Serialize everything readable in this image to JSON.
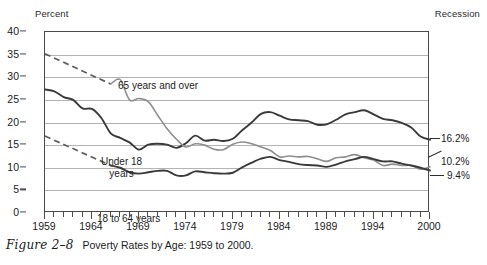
{
  "figure": {
    "number_label": "Figure 2–8",
    "caption": "Poverty Rates by Age: 1959 to 2000."
  },
  "labels": {
    "percent": "Percent",
    "recession": "Recession"
  },
  "annotations": {
    "series_65": "65 years and over",
    "series_under18_line1": "Under 18",
    "series_under18_line2": "years",
    "series_18to64": "18 to 64 years",
    "end_under18": "16.2%",
    "end_65": "10.2%",
    "end_18to64": "9.4%"
  },
  "colors": {
    "line_dark": "#3a3a3a",
    "line_gray": "#8e8e8e",
    "dashed": "#5c5c5c",
    "grid": "#b3b3b3",
    "frame": "#4a4a4a",
    "background": "#ffffff"
  },
  "chart_data": {
    "type": "line",
    "title": "Poverty Rates by Age: 1959 to 2000",
    "xlabel": "",
    "ylabel": "Percent",
    "xlim": [
      1959,
      2000
    ],
    "ylim": [
      0,
      40
    ],
    "yticks": [
      0,
      5,
      10,
      15,
      20,
      25,
      30,
      35,
      40
    ],
    "xticks_labeled": [
      1959,
      1964,
      1969,
      1974,
      1979,
      1984,
      1989,
      1994,
      2000
    ],
    "xtick_interval": 1,
    "grid": true,
    "legend": "inline-annotations",
    "x": [
      1959,
      1960,
      1961,
      1962,
      1963,
      1964,
      1965,
      1966,
      1967,
      1968,
      1969,
      1970,
      1971,
      1972,
      1973,
      1974,
      1975,
      1976,
      1977,
      1978,
      1979,
      1980,
      1981,
      1982,
      1983,
      1984,
      1985,
      1986,
      1987,
      1988,
      1989,
      1990,
      1991,
      1992,
      1993,
      1994,
      1995,
      1996,
      1997,
      1998,
      1999,
      2000
    ],
    "series": [
      {
        "name": "Under 18 years",
        "style": "solid-dark",
        "end_value": 16.2,
        "values": [
          27.3,
          26.9,
          25.6,
          25.0,
          23.1,
          23.0,
          21.0,
          17.6,
          16.6,
          15.6,
          14.0,
          15.1,
          15.3,
          15.1,
          14.4,
          15.4,
          17.1,
          16.0,
          16.2,
          15.9,
          16.4,
          18.3,
          20.0,
          21.9,
          22.3,
          21.5,
          20.7,
          20.5,
          20.3,
          19.5,
          19.6,
          20.6,
          21.8,
          22.3,
          22.7,
          21.8,
          20.8,
          20.5,
          19.9,
          18.9,
          16.9,
          16.2
        ]
      },
      {
        "name": "65 years and over",
        "style": "solid-gray",
        "end_value": 10.2,
        "dashed_segment": {
          "from_year": 1959,
          "from_value": 35.2,
          "to_year": 1966,
          "to_value": 28.5
        },
        "values": [
          35.2,
          null,
          null,
          null,
          null,
          null,
          null,
          28.5,
          29.5,
          25.0,
          25.3,
          24.6,
          21.6,
          18.6,
          16.3,
          14.6,
          15.3,
          15.0,
          14.1,
          14.0,
          15.2,
          15.7,
          15.3,
          14.6,
          13.8,
          12.4,
          12.6,
          12.4,
          12.5,
          12.0,
          11.4,
          12.2,
          12.4,
          12.9,
          12.2,
          11.7,
          10.5,
          10.8,
          10.5,
          10.5,
          9.7,
          10.2
        ]
      },
      {
        "name": "18 to 64 years",
        "style": "solid-dark",
        "end_value": 9.4,
        "dashed_segment": {
          "from_year": 1959,
          "from_value": 17.0,
          "to_year": 1966,
          "to_value": 10.5
        },
        "values": [
          17.0,
          null,
          null,
          null,
          null,
          null,
          null,
          10.5,
          10.0,
          9.0,
          8.7,
          9.0,
          9.3,
          9.3,
          8.3,
          8.3,
          9.2,
          9.0,
          8.8,
          8.7,
          8.9,
          10.1,
          11.1,
          12.0,
          12.4,
          11.7,
          11.3,
          10.8,
          10.6,
          10.5,
          10.2,
          10.7,
          11.4,
          11.9,
          12.4,
          11.9,
          11.4,
          11.4,
          10.9,
          10.5,
          10.0,
          9.4
        ]
      }
    ],
    "end_labels": [
      {
        "text": "16.2%",
        "series": "Under 18 years",
        "value": 16.2
      },
      {
        "text": "10.2%",
        "series": "65 years and over",
        "value": 10.2
      },
      {
        "text": "9.4%",
        "series": "18 to 64 years",
        "value": 9.4
      }
    ]
  }
}
